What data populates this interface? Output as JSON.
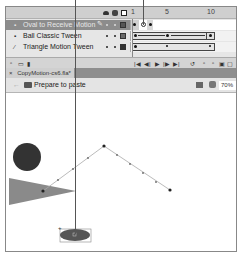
{
  "timeline": {
    "frame_numbers": [
      "1",
      "5",
      "10"
    ],
    "header_icons": [
      "eye-icon",
      "lock-icon",
      "outline-icon"
    ],
    "layers": [
      {
        "name": "Oval to Receive Motion",
        "icon": "layer-icon",
        "selected": true,
        "color": "#555555"
      },
      {
        "name": "Ball Classic Tween",
        "icon": "layer-icon",
        "selected": false,
        "color": "#6a6a6a"
      },
      {
        "name": "Triangle Motion Tween",
        "icon": "motion-layer-icon",
        "selected": false,
        "color": "#333333"
      }
    ],
    "footer_controls": [
      "|◀",
      "◀|",
      "▶",
      "|▶",
      "▶|"
    ]
  },
  "document": {
    "tab_close": "×",
    "tab_label": "CopyMotion-cs6.fla*"
  },
  "edit_bar": {
    "scene_label": "Prepare to paste",
    "zoom_value": "70%"
  },
  "stage": {
    "shapes": [
      "circle",
      "triangle",
      "oval"
    ],
    "motion_path_points": [
      [
        42,
        170
      ],
      [
        103,
        141
      ],
      [
        168,
        184
      ]
    ]
  }
}
